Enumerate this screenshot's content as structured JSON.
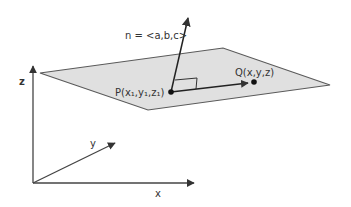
{
  "diagram": {
    "normal_label": "n = <a,b,c>",
    "point_p_label": "P(x₁,y₁,z₁)",
    "point_q_label": "Q(x,y,z)",
    "axes": {
      "x_label": "x",
      "y_label": "y",
      "z_label": "z"
    },
    "colors": {
      "plane_fill": "#e0e0e0",
      "plane_stroke": "#5a5a5a",
      "lines": "#333333",
      "points": "#111111"
    }
  }
}
